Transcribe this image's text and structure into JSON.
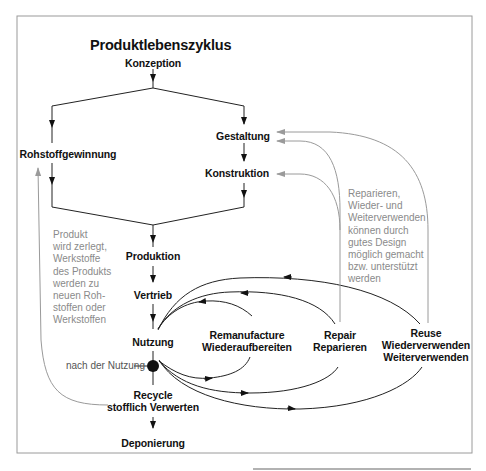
{
  "title": "Produktlebenszyklus",
  "nodes": {
    "konzeption": "Konzeption",
    "rohstoffgewinnung": "Rohstoffgewinnung",
    "gestaltung": "Gestaltung",
    "konstruktion": "Konstruktion",
    "produktion": "Produktion",
    "vertrieb": "Vertrieb",
    "nutzung": "Nutzung",
    "remanufacture": [
      "Remanufacture",
      "Wiederaufbereiten"
    ],
    "repair": [
      "Repair",
      "Reparieren"
    ],
    "reuse": [
      "Reuse",
      "Wiederverwenden",
      "Weiterverwenden"
    ],
    "recycle": [
      "Recycle",
      "stofflich Verwerten"
    ],
    "deponierung": "Deponierung"
  },
  "labels": {
    "nach_der_nutzung": "nach der Nutzung"
  },
  "notes": {
    "recycling_note": "Produkt\nwird zerlegt,\nWerkstoffe\ndes Produkts\nwerden zu\nneuen Roh-\nstoffen oder\nWerkstoffen",
    "design_note": "Reparieren,\nWieder- und\nWeiterverwenden\nkönnen durch\ngutes Design\nmöglich gemacht\nbzw. unterstützt\nwerden"
  },
  "colors": {
    "main_line": "#222222",
    "feedback_line": "#9a9a9a",
    "note_text": "#8a8a8a",
    "frame": "#8c8c8c"
  }
}
